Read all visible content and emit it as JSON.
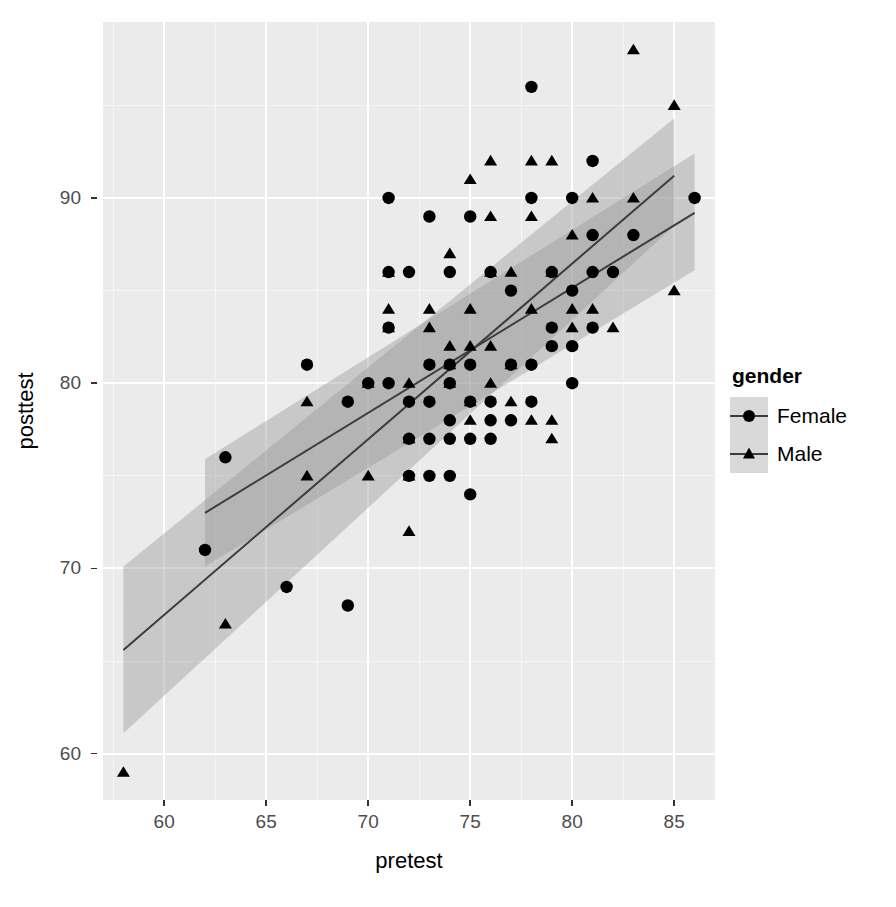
{
  "chart_data": {
    "type": "scatter",
    "title": "",
    "xlabel": "pretest",
    "ylabel": "posttest",
    "xlim": [
      57.0,
      87.0
    ],
    "ylim": [
      57.5,
      99.5
    ],
    "xticks": [
      60,
      65,
      70,
      75,
      80,
      85
    ],
    "yticks": [
      60,
      70,
      80,
      90
    ],
    "xtick_labels": [
      "60",
      "65",
      "70",
      "75",
      "80",
      "85"
    ],
    "ytick_labels": [
      "60",
      "70",
      "80",
      "90"
    ],
    "grid": true,
    "grid_major_color": "#FFFFFF",
    "grid_minor_color": "#F6F6F6",
    "panel_background": "#EBEBEB",
    "legend_position": "right",
    "legend_title": "gender",
    "point_color": "#000000",
    "line_color": "#3C3C3C",
    "ribbon_color": "#999999",
    "series": [
      {
        "name": "Female",
        "marker": "circle",
        "points": [
          [
            62,
            71
          ],
          [
            63,
            76
          ],
          [
            66,
            69
          ],
          [
            67,
            81
          ],
          [
            69,
            68
          ],
          [
            69,
            79
          ],
          [
            70,
            80
          ],
          [
            71,
            80
          ],
          [
            71,
            86
          ],
          [
            71,
            90
          ],
          [
            71,
            83
          ],
          [
            72,
            75
          ],
          [
            72,
            79
          ],
          [
            72,
            77
          ],
          [
            72,
            86
          ],
          [
            73,
            75
          ],
          [
            73,
            77
          ],
          [
            73,
            79
          ],
          [
            73,
            81
          ],
          [
            73,
            89
          ],
          [
            74,
            75
          ],
          [
            74,
            77
          ],
          [
            74,
            78
          ],
          [
            74,
            80
          ],
          [
            74,
            81
          ],
          [
            74,
            86
          ],
          [
            75,
            74
          ],
          [
            75,
            77
          ],
          [
            75,
            79
          ],
          [
            75,
            81
          ],
          [
            75,
            89
          ],
          [
            76,
            77
          ],
          [
            76,
            78
          ],
          [
            76,
            79
          ],
          [
            76,
            86
          ],
          [
            77,
            78
          ],
          [
            77,
            81
          ],
          [
            77,
            85
          ],
          [
            78,
            79
          ],
          [
            78,
            81
          ],
          [
            78,
            90
          ],
          [
            78,
            96
          ],
          [
            79,
            82
          ],
          [
            79,
            83
          ],
          [
            79,
            86
          ],
          [
            80,
            80
          ],
          [
            80,
            82
          ],
          [
            80,
            85
          ],
          [
            80,
            90
          ],
          [
            81,
            83
          ],
          [
            81,
            86
          ],
          [
            81,
            88
          ],
          [
            81,
            92
          ],
          [
            82,
            86
          ],
          [
            83,
            88
          ],
          [
            86,
            90
          ]
        ]
      },
      {
        "name": "Male",
        "marker": "triangle",
        "points": [
          [
            58,
            59
          ],
          [
            63,
            67
          ],
          [
            67,
            75
          ],
          [
            67,
            79
          ],
          [
            70,
            80
          ],
          [
            70,
            75
          ],
          [
            71,
            84
          ],
          [
            71,
            86
          ],
          [
            71,
            83
          ],
          [
            72,
            72
          ],
          [
            72,
            75
          ],
          [
            72,
            77
          ],
          [
            72,
            80
          ],
          [
            73,
            83
          ],
          [
            73,
            84
          ],
          [
            74,
            87
          ],
          [
            74,
            80
          ],
          [
            74,
            81
          ],
          [
            74,
            82
          ],
          [
            75,
            78
          ],
          [
            75,
            79
          ],
          [
            75,
            82
          ],
          [
            75,
            84
          ],
          [
            75,
            91
          ],
          [
            76,
            80
          ],
          [
            76,
            82
          ],
          [
            76,
            86
          ],
          [
            76,
            89
          ],
          [
            76,
            92
          ],
          [
            77,
            79
          ],
          [
            77,
            81
          ],
          [
            77,
            86
          ],
          [
            78,
            78
          ],
          [
            78,
            84
          ],
          [
            78,
            89
          ],
          [
            78,
            92
          ],
          [
            79,
            77
          ],
          [
            79,
            78
          ],
          [
            79,
            86
          ],
          [
            79,
            92
          ],
          [
            80,
            83
          ],
          [
            80,
            84
          ],
          [
            80,
            88
          ],
          [
            81,
            84
          ],
          [
            81,
            90
          ],
          [
            82,
            83
          ],
          [
            83,
            90
          ],
          [
            83,
            98
          ],
          [
            85,
            85
          ],
          [
            85,
            95
          ]
        ]
      }
    ],
    "fits": [
      {
        "name": "Female",
        "x_start": 62,
        "x_end": 86,
        "y_start": 73.0,
        "y_end": 89.2,
        "ci_lower_start": 70.1,
        "ci_lower_end": 86.1,
        "ci_upper_start": 75.9,
        "ci_upper_end": 92.4
      },
      {
        "name": "Male",
        "x_start": 58,
        "x_end": 85,
        "y_start": 65.6,
        "y_end": 91.2,
        "ci_lower_start": 61.1,
        "ci_lower_end": 88.5,
        "ci_upper_start": 70.1,
        "ci_upper_end": 94.3
      }
    ]
  },
  "axes": {
    "x_title": "pretest",
    "y_title": "posttest",
    "x_tick_labels": [
      "60",
      "65",
      "70",
      "75",
      "80",
      "85"
    ],
    "y_tick_labels": [
      "90",
      "80",
      "70",
      "60"
    ]
  },
  "legend": {
    "title": "gender",
    "items": [
      {
        "label": "Female",
        "marker": "circle"
      },
      {
        "label": "Male",
        "marker": "triangle"
      }
    ]
  }
}
